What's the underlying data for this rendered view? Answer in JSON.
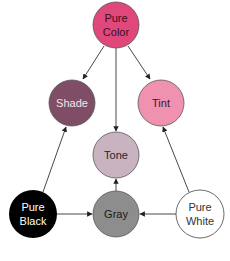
{
  "diagram": {
    "title": "",
    "nodes": {
      "pure_color": {
        "line1": "Pure",
        "line2": "Color",
        "fill": "#e0477a",
        "text": "#3a1020"
      },
      "shade": {
        "label": "Shade",
        "fill": "#7f4d66",
        "text": "#f2e6ec"
      },
      "tint": {
        "label": "Tint",
        "fill": "#f091b0",
        "text": "#3a1a26"
      },
      "tone": {
        "label": "Tone",
        "fill": "#c9b3c1",
        "text": "#2a2228"
      },
      "gray": {
        "label": "Gray",
        "fill": "#8d8d8d",
        "text": "#1a1a1a"
      },
      "pure_black": {
        "line1": "Pure",
        "line2": "Black",
        "fill": "#000000",
        "text": "#ffffff"
      },
      "pure_white": {
        "line1": "Pure",
        "line2": "White",
        "fill": "#ffffff",
        "text": "#333333"
      }
    },
    "edges": [
      {
        "from": "Pure Color",
        "to": "Shade"
      },
      {
        "from": "Pure Color",
        "to": "Tone"
      },
      {
        "from": "Pure Color",
        "to": "Tint"
      },
      {
        "from": "Pure Black",
        "to": "Shade"
      },
      {
        "from": "Pure White",
        "to": "Tint"
      },
      {
        "from": "Gray",
        "to": "Tone"
      },
      {
        "from": "Pure Black",
        "to": "Gray"
      },
      {
        "from": "Pure White",
        "to": "Gray"
      }
    ]
  }
}
